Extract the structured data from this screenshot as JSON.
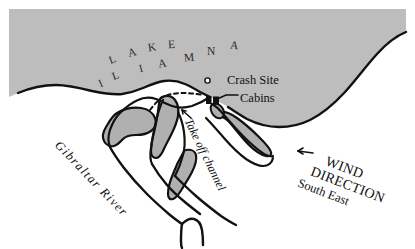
{
  "figure": {
    "kind": "hand-drawn-location-map",
    "background_color": "#ffffff",
    "water_fill_color": "#bdbdbd",
    "land_fill_color": "#ffffff",
    "island_fill_color": "#b0b0b0",
    "ink_color": "#111111"
  },
  "water_body": {
    "name_letters_row1": [
      "L",
      "A",
      "K",
      "E"
    ],
    "name_letters_row2": [
      "I",
      "L",
      "I",
      "A",
      "M",
      "N",
      "A"
    ],
    "name_full": "LAKE ILIAMNA"
  },
  "annotations": {
    "crash_site": {
      "label": "Crash Site",
      "marker": "small-open-circle"
    },
    "cabins": {
      "label": "Cabins",
      "marker": "two-black-squares",
      "leader": "line-from-label-to-marker"
    },
    "gibraltar_river": {
      "label": "Gibraltar River"
    },
    "takeoff_channel": {
      "label": "Take off channel",
      "marker": "arrow-pointing-up-left"
    },
    "wind": {
      "line1": "WIND",
      "line2": "DIRECTION",
      "line3": "South East",
      "marker": "arrow-pointing-left"
    }
  },
  "icons": {
    "crash_site_circle": "circle-marker-icon",
    "cabins_squares": "square-marker-icon",
    "wind_arrow": "arrow-left-icon",
    "channel_arrow": "arrow-up-left-icon"
  }
}
